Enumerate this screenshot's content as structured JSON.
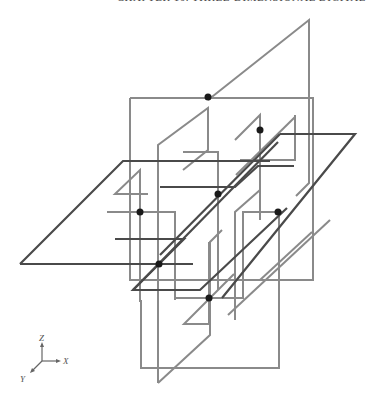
{
  "header": {
    "text": "CHAPTER 10.  THREE-DIMENSIONAL DIGITAL"
  },
  "diagram": {
    "colors": {
      "vertical_planes": "#8a8a8a",
      "horizontal_planes": "#4a4a4a",
      "points": "#1a1a1a"
    },
    "vertical_planes": [
      {
        "id": "tall-back-plane",
        "points": "208,97 208,270 309,185 309,20 208,97"
      },
      {
        "id": "tall-back-plane-right",
        "points": "309,20 309,185"
      },
      {
        "id": "big-front-square",
        "points": "122,308 122,98 313,98 313,308 122,308"
      },
      {
        "id": "left-inner-frame",
        "points": "107,192 107,130 208,130 208,161 122,161"
      },
      {
        "id": "center-vertical-plane",
        "points": "158,383 158,123 208,81 208,145 183,162"
      },
      {
        "id": "right-tall-square",
        "points": "232,98 232,161 287,161 287,98"
      },
      {
        "id": "lower-center-frame",
        "points": "175,298 175,161 255,161 255,298 175,298"
      },
      {
        "id": "lower-right-plane",
        "points": "209,334 209,184 262,142 262,275"
      },
      {
        "id": "bottom-diagonal",
        "points": "158,383 209,334"
      },
      {
        "id": "right-back-frame",
        "points": "312,117 312,250 275,282"
      }
    ],
    "horizontal_planes": [
      {
        "id": "big-left-parallelogram",
        "points": "20,264 123,161 260,161"
      },
      {
        "id": "big-bottom-edge",
        "points": "20,264 282,264"
      },
      {
        "id": "right-parallelogram",
        "points": "287,134 355,134 222,290 133,290"
      },
      {
        "id": "mid-parallelogram",
        "points": "115,239 184,239 159,264"
      },
      {
        "id": "inner-left-parallelogram",
        "points": "130,194 233,194 258,172 287,172"
      }
    ],
    "intersection_points": [
      {
        "x": 208,
        "y": 97
      },
      {
        "x": 260,
        "y": 130
      },
      {
        "x": 218,
        "y": 194
      },
      {
        "x": 140,
        "y": 212
      },
      {
        "x": 278,
        "y": 212
      },
      {
        "x": 159,
        "y": 264
      },
      {
        "x": 209,
        "y": 298
      }
    ]
  },
  "axes": {
    "z_label": "Z",
    "x_label": "X",
    "y_label": "Y"
  }
}
